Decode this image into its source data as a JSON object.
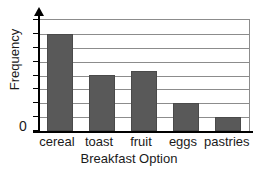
{
  "chart_data": {
    "type": "bar",
    "title": "",
    "xlabel": "Breakfast Option",
    "ylabel": "Frequency",
    "categories": [
      "cereal",
      "toast",
      "fruit",
      "eggs",
      "pastries"
    ],
    "values": [
      7,
      4,
      4.3,
      2,
      1
    ],
    "ylim": [
      0,
      8
    ],
    "ytick_labels": [
      "0"
    ],
    "ytick_values": [
      0
    ],
    "gridlines": 8,
    "grid": true,
    "legend": "none",
    "bar_color": "#595959",
    "grid_color": "#8c8c8c",
    "axis_color": "#000000",
    "background_color": "#ffffff"
  },
  "axes": {
    "y_axis_arrow": "arrow-up-icon",
    "zero_label": "0"
  }
}
